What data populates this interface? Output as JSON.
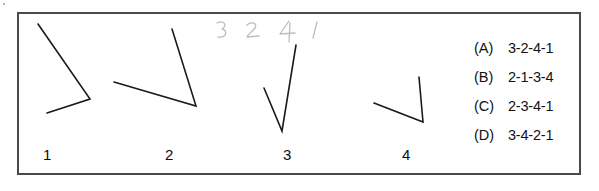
{
  "page": {
    "background_color": "#ffffff",
    "border_color": "#4a4a4a",
    "ink_color": "#1a1a1a",
    "pencil_color": "#b9b9b9"
  },
  "figures": {
    "caption_labels": [
      "1",
      "2",
      "3",
      "4"
    ],
    "items": [
      {
        "name": "angle-figure-1",
        "label": "1",
        "vertex": [
          90,
          99
        ],
        "ray_a_end": [
          38,
          24
        ],
        "ray_b_end": [
          47,
          113
        ]
      },
      {
        "name": "angle-figure-2",
        "label": "2",
        "vertex": [
          196,
          106
        ],
        "ray_a_end": [
          172,
          29
        ],
        "ray_b_end": [
          114,
          82
        ]
      },
      {
        "name": "angle-figure-3",
        "label": "3",
        "vertex": [
          282,
          131
        ],
        "ray_a_end": [
          296,
          45
        ],
        "ray_b_end": [
          264,
          88
        ]
      },
      {
        "name": "angle-figure-4",
        "label": "4",
        "vertex": [
          423,
          122
        ],
        "ray_a_end": [
          419,
          77
        ],
        "ray_b_end": [
          374,
          103
        ]
      }
    ]
  },
  "handwriting": {
    "text": "3 2 4 1",
    "marks": [
      "3",
      "2",
      "4",
      "1"
    ]
  },
  "answers": {
    "options": [
      {
        "letter": "(A)",
        "text": "3-2-4-1"
      },
      {
        "letter": "(B)",
        "text": "2-1-3-4"
      },
      {
        "letter": "(C)",
        "text": "2-3-4-1"
      },
      {
        "letter": "(D)",
        "text": "3-4-2-1"
      }
    ]
  }
}
